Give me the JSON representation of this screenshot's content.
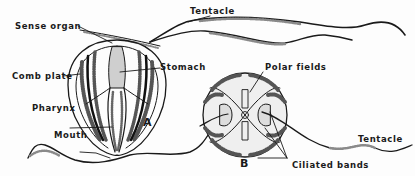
{
  "diagram": {
    "figure_a": {
      "letter": "A",
      "labels": {
        "tentacle": "Tentacle",
        "sense_organ": "Sense organ",
        "stomach": "Stomach",
        "comb_plate": "Comb plate",
        "pharynx": "Pharynx",
        "mouth": "Mouth"
      }
    },
    "figure_b": {
      "letter": "B",
      "labels": {
        "polar_fields": "Polar fields",
        "tentacle": "Tentacle",
        "ciliated_bands": "Ciliated bands"
      }
    },
    "colors": {
      "ink": "#1a1a1a",
      "shade": "#8a8a8a",
      "background": "#fdfdfd"
    }
  }
}
